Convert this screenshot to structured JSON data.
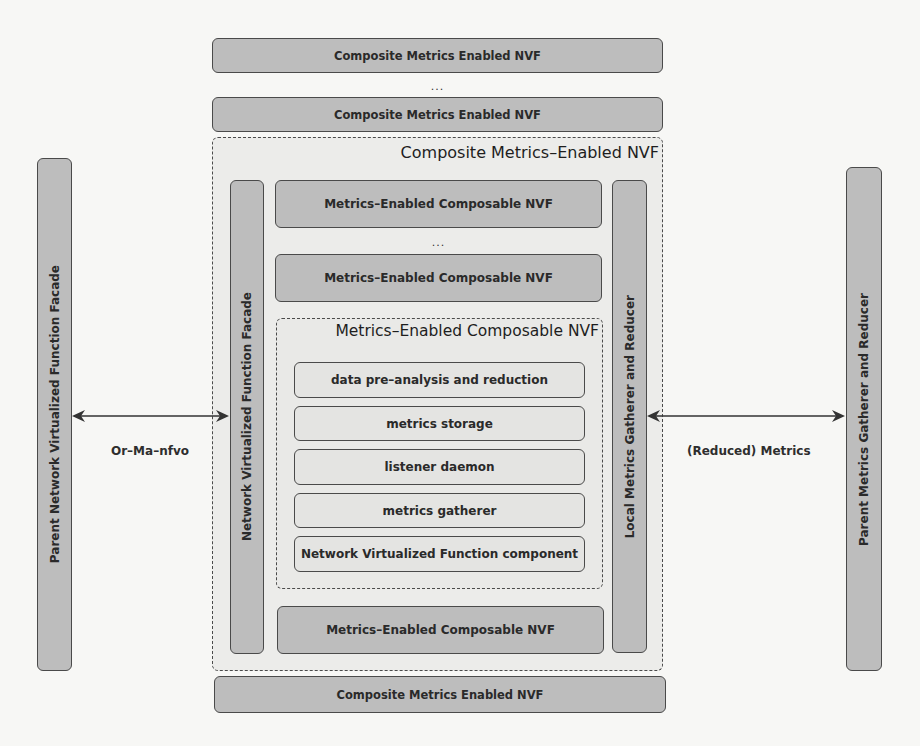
{
  "diagram": {
    "top_stack": {
      "bar_1": "Composite Metrics Enabled NVF",
      "ellipsis": "...",
      "bar_2": "Composite Metrics Enabled NVF"
    },
    "outer_container": {
      "title": "Composite Metrics–Enabled NVF",
      "left_pillar": "Network Virtualized Function Facade",
      "right_pillar": "Local Metrics Gatherer and Reducer",
      "composable_1": "Metrics–Enabled Composable NVF",
      "ellipsis": "...",
      "composable_2": "Metrics–Enabled Composable NVF",
      "inner_container": {
        "title": "Metrics–Enabled Composable NVF",
        "components": [
          "data pre–analysis and reduction",
          "metrics storage",
          "listener daemon",
          "metrics gatherer",
          "Network Virtualized Function component"
        ]
      },
      "composable_3": "Metrics–Enabled Composable NVF"
    },
    "bottom_bar": "Composite Metrics Enabled NVF",
    "left_external": "Parent Network Virtualized Function Facade",
    "right_external": "Parent Metrics Gatherer and Reducer",
    "left_edge_label": "Or–Ma–nfvo",
    "right_edge_label": "(Reduced) Metrics",
    "colors": {
      "solid_box": "#bdbdbd",
      "light_box": "#e4e4e2",
      "border": "#4a4a4a",
      "background": "#f7f7f5"
    }
  }
}
